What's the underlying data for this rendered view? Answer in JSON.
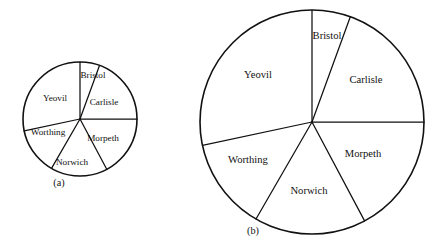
{
  "figure": {
    "background": "#ffffff",
    "ink": "#111111",
    "caption_a": "(a)",
    "caption_b": "(b)"
  },
  "chart_data": {
    "type": "pie",
    "title": "",
    "xlabel": "",
    "ylabel": "",
    "legend": "none",
    "grid": false,
    "note": "Two pie charts showing the same six categories with identical proportions; (a) is drawn at a smaller radius than (b).",
    "categories": [
      "Bristol",
      "Carlisle",
      "Morpeth",
      "Norwich",
      "Worthing",
      "Yeovil"
    ],
    "angles_deg": [
      20,
      70,
      62,
      58,
      48,
      102
    ],
    "values_percent": [
      5.6,
      19.4,
      17.2,
      16.1,
      13.3,
      28.3
    ],
    "charts": [
      {
        "name": "(a)",
        "caption": "(a)",
        "center_x": 80,
        "center_y": 119,
        "radius": 57,
        "label_font_px": 9.2,
        "slices": [
          {
            "label": "Bristol",
            "start_deg": 0,
            "end_deg": 20,
            "label_x": 93,
            "label_y": 76
          },
          {
            "label": "Carlisle",
            "start_deg": 20,
            "end_deg": 90,
            "label_x": 104,
            "label_y": 103
          },
          {
            "label": "Morpeth",
            "start_deg": 90,
            "end_deg": 152,
            "label_x": 103,
            "label_y": 139
          },
          {
            "label": "Norwich",
            "start_deg": 152,
            "end_deg": 210,
            "label_x": 72,
            "label_y": 163
          },
          {
            "label": "Worthing",
            "start_deg": 210,
            "end_deg": 258,
            "label_x": 48,
            "label_y": 133
          },
          {
            "label": "Yeovil",
            "start_deg": 258,
            "end_deg": 360,
            "label_x": 55,
            "label_y": 99
          }
        ]
      },
      {
        "name": "(b)",
        "caption": "(b)",
        "center_x": 312,
        "center_y": 122,
        "radius": 112,
        "label_font_px": 10.6,
        "slices": [
          {
            "label": "Bristol",
            "start_deg": 0,
            "end_deg": 20,
            "label_x": 327,
            "label_y": 37
          },
          {
            "label": "Carlisle",
            "start_deg": 20,
            "end_deg": 90,
            "label_x": 366,
            "label_y": 81
          },
          {
            "label": "Morpeth",
            "start_deg": 90,
            "end_deg": 152,
            "label_x": 363,
            "label_y": 155
          },
          {
            "label": "Norwich",
            "start_deg": 152,
            "end_deg": 210,
            "label_x": 309,
            "label_y": 192
          },
          {
            "label": "Worthing",
            "start_deg": 210,
            "end_deg": 258,
            "label_x": 248,
            "label_y": 161
          },
          {
            "label": "Yeovil",
            "start_deg": 258,
            "end_deg": 360,
            "label_x": 258,
            "label_y": 76
          }
        ]
      }
    ],
    "captions": [
      {
        "text": "(a)",
        "x": 59,
        "y": 186
      },
      {
        "text": "(b)",
        "x": 253,
        "y": 234
      }
    ]
  }
}
